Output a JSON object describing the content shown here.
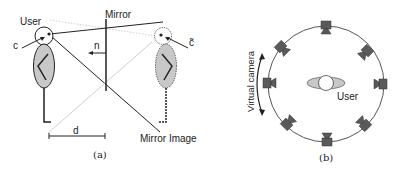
{
  "figure_a": {
    "caption": "(a)",
    "labels": {
      "user": "User",
      "mirror": "Mirror",
      "normal": "n",
      "camera": "c",
      "mirrored_camera": "c̃",
      "distance": "d",
      "mirror_image": "Mirror Image"
    }
  },
  "figure_b": {
    "caption": "(b)",
    "labels": {
      "user": "User",
      "virtual_camera": "Virtual camera"
    },
    "camera_count": 8
  },
  "colors": {
    "line": "#222222",
    "body_fill": "#c8c8c8",
    "camera_fill": "#5a5a5a",
    "circle_stroke": "#555555",
    "dotted_line": "#aaaaaa"
  }
}
